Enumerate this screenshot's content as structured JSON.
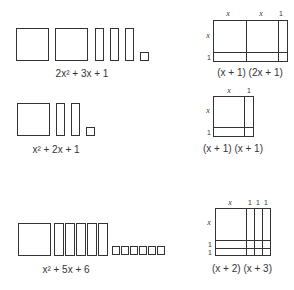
{
  "rows": [
    {
      "tiles_label": "2x² + 3x + 1",
      "tiles": {
        "x_squared": 2,
        "x": 3,
        "unit": 1
      },
      "factor_labels": {
        "top": [
          "x",
          "x",
          "1"
        ],
        "side": [
          "x",
          "1"
        ]
      },
      "factored_label": "(x + 1) (2x + 1)"
    },
    {
      "tiles_label": "x² + 2x + 1",
      "tiles": {
        "x_squared": 1,
        "x": 2,
        "unit": 1
      },
      "factor_labels": {
        "top": [
          "x",
          "1"
        ],
        "side": [
          "x",
          "1"
        ]
      },
      "factored_label": "(x + 1) (x + 1)"
    },
    {
      "tiles_label": "x² + 5x + 6",
      "tiles": {
        "x_squared": 1,
        "x": 5,
        "unit": 6
      },
      "factor_labels": {
        "top": [
          "x",
          "1",
          "1",
          "1"
        ],
        "side": [
          "x",
          "1",
          "1"
        ]
      },
      "factored_label": "(x + 2) (x + 3)"
    }
  ],
  "colors": {
    "stroke": "#333333",
    "background": "#ffffff"
  }
}
